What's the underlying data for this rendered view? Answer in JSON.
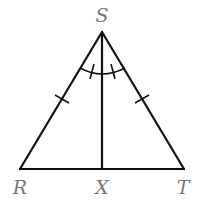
{
  "figure": {
    "type": "isosceles triangle with angle bisector",
    "vertices": {
      "S": {
        "label": "S",
        "x": 102,
        "y": 32
      },
      "R": {
        "label": "R",
        "x": 20,
        "y": 169
      },
      "T": {
        "label": "T",
        "x": 184,
        "y": 169
      },
      "X": {
        "label": "X",
        "x": 102,
        "y": 169
      }
    },
    "segments": [
      "SR",
      "ST",
      "RT",
      "SX"
    ],
    "congruence_marks": {
      "sides": [
        "SR",
        "ST"
      ],
      "angles": [
        "RSX",
        "XSY"
      ]
    },
    "colors": {
      "stroke": "#111111",
      "label": "#777777"
    }
  },
  "labels": {
    "S": "S",
    "R": "R",
    "X": "X",
    "T": "T"
  }
}
